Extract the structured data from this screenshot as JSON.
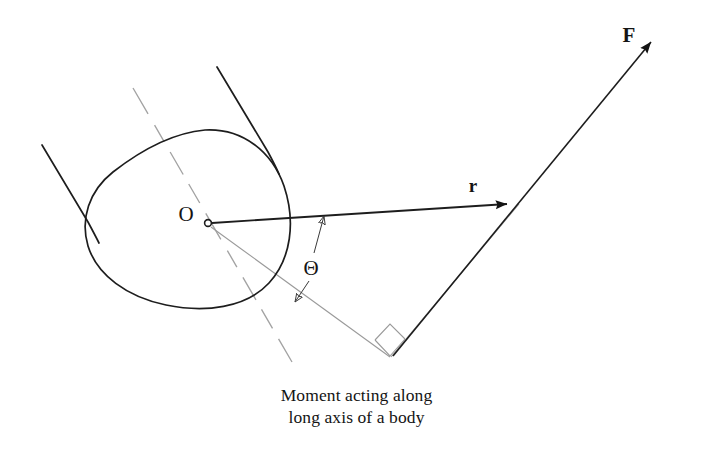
{
  "figure": {
    "caption_line1": "Moment acting along",
    "caption_line2": "long axis of a body",
    "background_color": "#ffffff",
    "ink_color": "#141414",
    "construction_color": "#9a9a9a"
  },
  "labels": {
    "force_vector": "F",
    "moment_arm_vector": "r",
    "pivot_point": "O",
    "angle_symbol": "Θ"
  },
  "diagram_data": {
    "type": "free-body-diagram",
    "description": "Moment acting along long axis of a body",
    "elements": [
      {
        "name": "body-outline",
        "kind": "closed-curve",
        "style": "solid",
        "color": "#141414",
        "bbox": [
          85,
          128,
          292,
          308
        ]
      },
      {
        "name": "long-axis",
        "kind": "line",
        "style": "dashed",
        "color": "#9a9a9a",
        "from": [
          133,
          88
        ],
        "to": [
          292,
          362
        ]
      },
      {
        "name": "limb-line-left",
        "kind": "line",
        "style": "solid",
        "color": "#141414",
        "from": [
          42,
          145
        ],
        "to": [
          97,
          233
        ]
      },
      {
        "name": "limb-line-right",
        "kind": "line",
        "style": "solid",
        "color": "#141414",
        "from": [
          217,
          67
        ],
        "to": [
          277,
          168
        ]
      },
      {
        "name": "pivot-marker",
        "kind": "circle",
        "style": "open",
        "color": "#141414",
        "center": [
          208,
          223
        ],
        "radius": 3.4
      },
      {
        "name": "moment-arm-vector-r",
        "kind": "arrow",
        "style": "solid-filled-head",
        "color": "#141414",
        "from": [
          210,
          223
        ],
        "to": [
          519,
          203
        ]
      },
      {
        "name": "force-vector-F",
        "kind": "arrow",
        "style": "solid-filled-head",
        "color": "#141414",
        "from": [
          393,
          356
        ],
        "to": [
          663,
          28
        ]
      },
      {
        "name": "construction-line-pivot-to-vertex",
        "kind": "line",
        "style": "solid-thin",
        "color": "#9a9a9a",
        "from": [
          210,
          226
        ],
        "to": [
          390,
          357
        ]
      },
      {
        "name": "right-angle-marker",
        "kind": "square",
        "color": "#9a9a9a",
        "vertex": [
          390,
          356
        ],
        "size": 22
      },
      {
        "name": "angle-theta",
        "kind": "angle-dimension",
        "between": [
          "moment-arm-vector-r",
          "construction-line-pivot-to-vertex"
        ],
        "vertex": [
          210,
          224
        ],
        "label": "Θ"
      }
    ],
    "label_positions": {
      "F": [
        629,
        42
      ],
      "r": [
        472,
        190
      ],
      "O": [
        178,
        220
      ],
      "theta": [
        305,
        268
      ]
    }
  }
}
